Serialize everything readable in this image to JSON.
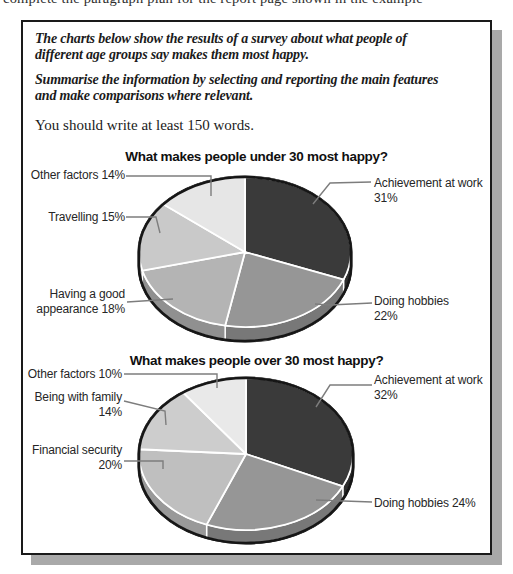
{
  "page": {
    "top_clipped_text": "complete the paragraph plan for the report page shown in the example"
  },
  "task_box": {
    "prompt1": {
      "line1": "The charts below show the results of a survey about what people of",
      "line2": "different age groups say makes them most happy."
    },
    "prompt2": {
      "line1": "Summarise the information by selecting and reporting the main features",
      "line2": "and make comparisons where relevant."
    },
    "note": "You should write at least 150 words."
  },
  "chart_data": [
    {
      "type": "pie",
      "style": "3d",
      "title": "What makes people under 30 most happy?",
      "unit": "%",
      "order": "clockwise from 12 o'clock",
      "slices": [
        {
          "label": "Achievement at work",
          "value": 31,
          "color": "#3a3a3a",
          "callout_lines": [
            "Achievement at work",
            "31%"
          ]
        },
        {
          "label": "Doing hobbies",
          "value": 22,
          "color": "#969696",
          "callout_lines": [
            "Doing hobbies",
            "22%"
          ]
        },
        {
          "label": "Having a good appearance",
          "value": 18,
          "color": "#b4b4b4",
          "callout_lines": [
            "Having a good",
            "appearance 18%"
          ]
        },
        {
          "label": "Travelling",
          "value": 15,
          "color": "#c9c9c9",
          "callout_lines": [
            "Travelling 15%"
          ]
        },
        {
          "label": "Other factors",
          "value": 14,
          "color": "#e6e6e6",
          "callout_lines": [
            "Other factors 14%"
          ]
        }
      ]
    },
    {
      "type": "pie",
      "style": "3d",
      "title": "What makes people over 30 most happy?",
      "unit": "%",
      "order": "clockwise from 12 o'clock",
      "slices": [
        {
          "label": "Achievement at work",
          "value": 32,
          "color": "#3a3a3a",
          "callout_lines": [
            "Achievement at work",
            "32%"
          ]
        },
        {
          "label": "Doing hobbies",
          "value": 24,
          "color": "#969696",
          "callout_lines": [
            "Doing hobbies 24%"
          ]
        },
        {
          "label": "Financial security",
          "value": 20,
          "color": "#bfbfbf",
          "callout_lines": [
            "Financial security",
            "20%"
          ]
        },
        {
          "label": "Being with family",
          "value": 14,
          "color": "#cdcdcd",
          "callout_lines": [
            "Being with family",
            "14%"
          ]
        },
        {
          "label": "Other factors",
          "value": 10,
          "color": "#e9e9e9",
          "callout_lines": [
            "Other factors 10%"
          ]
        }
      ]
    }
  ]
}
